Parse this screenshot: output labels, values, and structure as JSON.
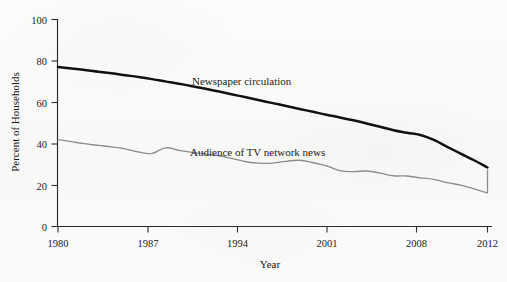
{
  "chart_data": {
    "type": "line",
    "title": "",
    "xlabel": "Year",
    "ylabel": "Percent of Households",
    "xlim": [
      1980,
      2012
    ],
    "ylim": [
      0,
      100
    ],
    "xticks": [
      1980,
      1987,
      1994,
      2001,
      2008,
      2012
    ],
    "xtick_labels": [
      "1980",
      "1987",
      "1994",
      "2001",
      "2008",
      "2012"
    ],
    "yticks": [
      0,
      20,
      40,
      60,
      80,
      100
    ],
    "ytick_labels": [
      "0",
      "20",
      "40",
      "60",
      "80",
      "100"
    ],
    "grid": false,
    "legend_position": "inline-annotations",
    "x": [
      1980,
      1981,
      1982,
      1983,
      1984,
      1985,
      1986,
      1987,
      1988,
      1989,
      1990,
      1991,
      1992,
      1993,
      1994,
      1995,
      1996,
      1997,
      1998,
      1999,
      2000,
      2001,
      2002,
      2003,
      2004,
      2005,
      2006,
      2007,
      2008,
      2009,
      2010,
      2011,
      2012
    ],
    "series": [
      {
        "name": "Newspaper circulation",
        "color": "#111111",
        "line_width": "thick",
        "label_x": 1995,
        "label_y": 68,
        "values": [
          77,
          76.3,
          75.6,
          74.8,
          74,
          73.1,
          72.2,
          71.2,
          70.1,
          69,
          67.8,
          66.5,
          65.2,
          63.8,
          62.4,
          61,
          59.6,
          58.2,
          56.8,
          55.4,
          54,
          52.7,
          51.3,
          49.8,
          48.2,
          46.5,
          45.3,
          44.2,
          41.8,
          38.5,
          35.2,
          32,
          28.5
        ]
      },
      {
        "name": "Audience of TV network news",
        "color": "#8d8d8d",
        "line_width": "thin",
        "label_x": 1996,
        "label_y": 40,
        "values": [
          42,
          41,
          40,
          39.2,
          38.5,
          37.5,
          36,
          35.3,
          38,
          36.8,
          35.8,
          35,
          34.2,
          32.8,
          31.3,
          30.6,
          30.6,
          31.5,
          32,
          30.8,
          29.3,
          27,
          26.5,
          26.8,
          25.8,
          24.5,
          24.4,
          23.5,
          22.8,
          21.2,
          20,
          18.2,
          16.2
        ]
      }
    ],
    "series_tail_note": {
      "Audience of TV network news": [
        {
          "x": 2008,
          "y": 16.2
        },
        {
          "x": 2012,
          "y": 27.2
        }
      ]
    },
    "annotations": [
      {
        "text": "Newspaper circulation",
        "x_px": 192,
        "y_px": 85
      },
      {
        "text": "Audience of TV network news",
        "x_px": 190,
        "y_px": 156
      }
    ]
  },
  "axes": {
    "y_title": "Percent of Households",
    "x_title": "Year"
  }
}
